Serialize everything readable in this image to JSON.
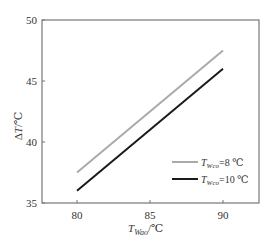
{
  "chart_data": {
    "type": "line",
    "title": "",
    "xlabel": "T_Wao/℃",
    "ylabel": "ΔT/℃",
    "xlim": [
      77.6,
      92.5
    ],
    "ylim": [
      35,
      50
    ],
    "x_ticks": [
      80,
      85,
      90
    ],
    "y_ticks": [
      35,
      40,
      45,
      50
    ],
    "grid": false,
    "legend_position": "lower right",
    "series": [
      {
        "name": "T_Wco=8 ℃",
        "color": "#aaaaaa",
        "x": [
          80,
          90
        ],
        "y": [
          37.5,
          47.5
        ]
      },
      {
        "name": "T_Wco=10 ℃",
        "color": "#1a1a1a",
        "x": [
          80,
          90
        ],
        "y": [
          36.0,
          46.0
        ]
      }
    ]
  },
  "labels": {
    "x_main": "T",
    "x_sub": "Wao",
    "x_unit": "/℃",
    "y_main": "ΔT",
    "y_unit": "/℃",
    "legend": [
      {
        "main": "T",
        "sub": "Wco",
        "rest": "=8 ℃"
      },
      {
        "main": "T",
        "sub": "Wco",
        "rest": "=10 ℃"
      }
    ]
  }
}
